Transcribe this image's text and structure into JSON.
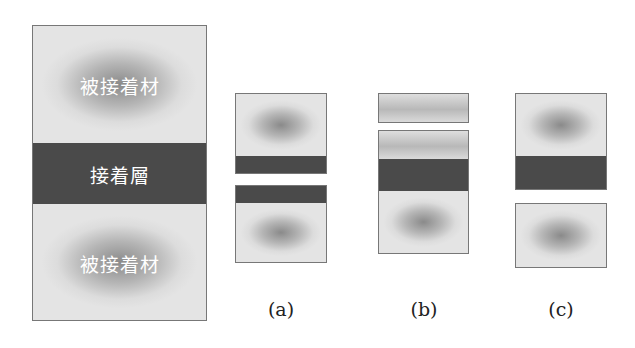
{
  "figure": {
    "main": {
      "adherend_top_label": "被接着材",
      "adhesive_label": "接着層",
      "adherend_bottom_label": "被接着材"
    },
    "captions": [
      "(a)",
      "(b)",
      "(c)"
    ],
    "colors": {
      "adhesive": "#4a4a4a",
      "adherend_center": "#8a8a8a",
      "adherend_edge": "#e4e4e4",
      "border": "#777777"
    }
  }
}
